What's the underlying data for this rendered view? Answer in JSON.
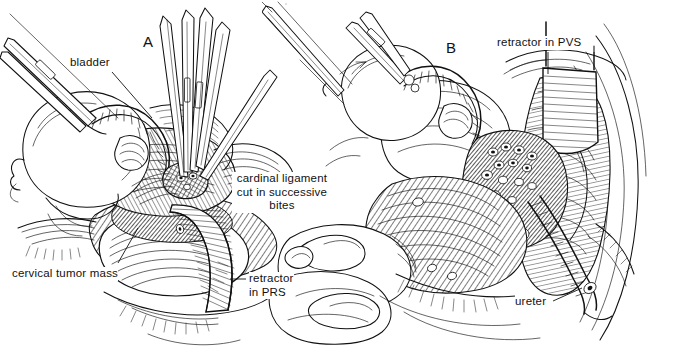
{
  "figure": {
    "background_color": "#ffffff",
    "ink_color": "#111111",
    "style": "pen-and-ink line drawing with cross-hatching",
    "width": 679,
    "height": 353
  },
  "panels": [
    {
      "id": "A",
      "letter": "A",
      "caption": "Cardinal ligament being clamped and cut in successive bites with the bladder retracted and the cervical tumor mass exposed."
    },
    {
      "id": "B",
      "letter": "B",
      "caption": "Paravesical space opened with a retractor; ligated vessel stumps and the ureter are displayed."
    }
  ],
  "labels": [
    {
      "id": "bladder",
      "text": "bladder",
      "panel": "A",
      "align": "left",
      "x": 70,
      "y": 56,
      "leader": {
        "x1": 112,
        "y1": 72,
        "x2": 152,
        "y2": 118
      }
    },
    {
      "id": "cardinal-ligament",
      "text": "cardinal ligament\ncut in successive\nbites",
      "panel": "A",
      "align": "center",
      "x": 232,
      "y": 172,
      "leader": null
    },
    {
      "id": "cervical-tumor-mass",
      "text": "cervical tumor mass",
      "panel": "A",
      "align": "left",
      "x": 12,
      "y": 267,
      "leader": {
        "x1": 118,
        "y1": 266,
        "x2": 138,
        "y2": 230
      }
    },
    {
      "id": "retractor-in-prs",
      "text": "retractor\nin PRS",
      "panel": "A",
      "align": "left",
      "x": 248,
      "y": 272,
      "leader": {
        "x1": 245,
        "y1": 279,
        "x2": 229,
        "y2": 279
      }
    },
    {
      "id": "retractor-in-pvs",
      "text": "retractor in PVS",
      "panel": "B",
      "align": "left",
      "x": 497,
      "y": 36,
      "leader": {
        "x1": 548,
        "y1": 52,
        "x2": 548,
        "y2": 78
      }
    },
    {
      "id": "ureter",
      "text": "ureter",
      "panel": "B",
      "align": "left",
      "x": 515,
      "y": 298,
      "leader": {
        "x1": 552,
        "y1": 300,
        "x2": 586,
        "y2": 286
      }
    }
  ],
  "panel_letters": [
    {
      "id": "letter-a",
      "text": "A",
      "x": 143,
      "y": 34
    },
    {
      "id": "letter-b",
      "text": "B",
      "x": 446,
      "y": 40
    }
  ],
  "structures": {
    "panel_a": [
      "bladder dome retracted anteriorly",
      "uterine corpus / cervix with tumor mass",
      "cardinal ligament pedicle",
      "paravesical / pararectal space",
      "curved retractor blade in pararectal space (PRS)",
      "multiple long curved surgical clamps",
      "tissue forceps grasping bladder"
    ],
    "panel_b": [
      "bladder retracted by forceps",
      "loops of small bowel packed inferiorly",
      "opened paravesical space (PVS)",
      "flat hatched retractor blade in PVS",
      "ligated vessel stumps / clipped pedicles",
      "ureter coursing inferolaterally",
      "pelvic sidewall musculature"
    ]
  }
}
